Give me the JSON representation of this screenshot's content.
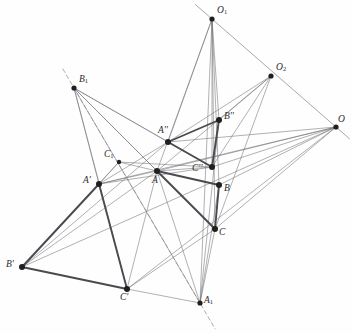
{
  "figure": {
    "width": 334,
    "height": 334,
    "background_color": "#fefefe",
    "line_color_thin": "#6f6f74",
    "line_color_bold": "#4a4a50",
    "dash_color": "#8a8a8f",
    "point_color": "#1f1f1f",
    "label_color": "#2b2b2b"
  },
  "points": [
    {
      "id": "O1",
      "label": "O",
      "sub": "1",
      "prime": "",
      "x": 212,
      "y": 19,
      "lx": 217,
      "ly": 6,
      "r": 2.6
    },
    {
      "id": "O2",
      "label": "O",
      "sub": "2",
      "prime": "",
      "x": 271,
      "y": 76,
      "lx": 276,
      "ly": 63,
      "r": 2.6
    },
    {
      "id": "O",
      "label": "O",
      "sub": "",
      "prime": "",
      "x": 336,
      "y": 127,
      "lx": 338,
      "ly": 115,
      "r": 2.6
    },
    {
      "id": "B1",
      "label": "B",
      "sub": "1",
      "prime": "",
      "x": 74,
      "y": 88,
      "lx": 79,
      "ly": 75,
      "r": 2.6
    },
    {
      "id": "A2",
      "label": "A",
      "sub": "",
      "prime": "''",
      "x": 168,
      "y": 142,
      "lx": 158,
      "ly": 126,
      "r": 3.0
    },
    {
      "id": "B2",
      "label": "B",
      "sub": "",
      "prime": "''",
      "x": 219,
      "y": 120,
      "lx": 224,
      "ly": 112,
      "r": 3.0
    },
    {
      "id": "C2",
      "label": "C",
      "sub": "",
      "prime": "''",
      "x": 212,
      "y": 167,
      "lx": 192,
      "ly": 164,
      "r": 3.0
    },
    {
      "id": "C1",
      "label": "C",
      "sub": "1",
      "prime": "",
      "x": 119,
      "y": 162,
      "lx": 104,
      "ly": 150,
      "r": 2.2
    },
    {
      "id": "A",
      "label": "A",
      "sub": "",
      "prime": "",
      "x": 157,
      "y": 171,
      "lx": 152,
      "ly": 176,
      "r": 3.0
    },
    {
      "id": "B",
      "label": "B",
      "sub": "",
      "prime": "",
      "x": 219,
      "y": 185,
      "lx": 224,
      "ly": 184,
      "r": 3.0
    },
    {
      "id": "C",
      "label": "C",
      "sub": "",
      "prime": "",
      "x": 215,
      "y": 229,
      "lx": 219,
      "ly": 228,
      "r": 3.0
    },
    {
      "id": "Ap",
      "label": "A",
      "sub": "",
      "prime": "'",
      "x": 99,
      "y": 184,
      "lx": 83,
      "ly": 176,
      "r": 3.0
    },
    {
      "id": "Bp",
      "label": "B",
      "sub": "",
      "prime": "'",
      "x": 22,
      "y": 267,
      "lx": 6,
      "ly": 260,
      "r": 3.0
    },
    {
      "id": "Cp",
      "label": "C",
      "sub": "",
      "prime": "'",
      "x": 127,
      "y": 289,
      "lx": 120,
      "ly": 293,
      "r": 3.0
    },
    {
      "id": "A1",
      "label": "A",
      "sub": "1",
      "prime": "",
      "x": 200,
      "y": 303,
      "lx": 204,
      "ly": 296,
      "r": 2.6
    }
  ],
  "triangles": [
    {
      "name": "triangle-ABC",
      "vertices": [
        "A",
        "B",
        "C"
      ],
      "style": "bold"
    },
    {
      "name": "triangle-A-prime",
      "vertices": [
        "Ap",
        "Bp",
        "Cp"
      ],
      "style": "bold"
    },
    {
      "name": "triangle-A-dprime",
      "vertices": [
        "A2",
        "B2",
        "C2"
      ],
      "style": "bold"
    }
  ],
  "thin_segments": [
    [
      "O1",
      "A2"
    ],
    [
      "O1",
      "B2"
    ],
    [
      "O1",
      "C2"
    ],
    [
      "O1",
      "A"
    ],
    [
      "O1",
      "B"
    ],
    [
      "O1",
      "C"
    ],
    [
      "O1",
      "A1"
    ],
    [
      "O2",
      "A2"
    ],
    [
      "O2",
      "B2"
    ],
    [
      "O2",
      "C2"
    ],
    [
      "O2",
      "A"
    ],
    [
      "O2",
      "C"
    ],
    [
      "O",
      "A"
    ],
    [
      "O",
      "B"
    ],
    [
      "O",
      "C"
    ],
    [
      "O",
      "A2"
    ],
    [
      "O",
      "C2"
    ],
    [
      "O",
      "Ap"
    ],
    [
      "O",
      "Cp"
    ],
    [
      "O",
      "Bp"
    ],
    [
      "B1",
      "A2"
    ],
    [
      "B1",
      "C2"
    ],
    [
      "B1",
      "A"
    ],
    [
      "B1",
      "Ap"
    ],
    [
      "B1",
      "Cp"
    ],
    [
      "B1",
      "C"
    ],
    [
      "B1",
      "A1"
    ],
    [
      "Ap",
      "A"
    ],
    [
      "Ap",
      "C2"
    ],
    [
      "Ap",
      "A2"
    ],
    [
      "Bp",
      "A"
    ],
    [
      "Bp",
      "A2"
    ],
    [
      "Bp",
      "C1"
    ],
    [
      "Cp",
      "A"
    ],
    [
      "Cp",
      "A1"
    ],
    [
      "Cp",
      "C"
    ],
    [
      "C1",
      "A"
    ],
    [
      "C1",
      "C2"
    ],
    [
      "C1",
      "Ap"
    ],
    [
      "A1",
      "A"
    ],
    [
      "A1",
      "B"
    ],
    [
      "A1",
      "C"
    ],
    [
      "A1",
      "B2"
    ],
    [
      "A",
      "C2"
    ]
  ],
  "dashed_path": {
    "name": "dashed-axis-B1-C1-A1",
    "from": "B1",
    "through": [
      "C1"
    ],
    "to": "A1",
    "extend_start": 22,
    "extend_end": 30
  },
  "axis_line": {
    "name": "perspective-axis-O1-O2-O",
    "from": "O1",
    "to": "O",
    "extend_start": 22,
    "extend_end": 18
  },
  "labels": {
    "O1": "O₁",
    "O2": "O₂",
    "O": "O",
    "B1": "B₁",
    "C1": "C₁",
    "A1": "A₁",
    "A": "A",
    "B": "B",
    "C": "C",
    "Ap": "A'",
    "Bp": "B'",
    "Cp": "C'",
    "A2": "A''",
    "B2": "B''",
    "C2": "C''"
  }
}
